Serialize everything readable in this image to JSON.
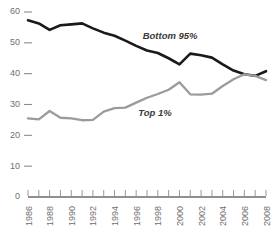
{
  "chart_data": {
    "type": "line",
    "title": "",
    "subtitle": "",
    "xlabel": "",
    "ylabel": "",
    "xlim": [
      1986,
      2008
    ],
    "ylim": [
      0,
      60
    ],
    "grid": false,
    "legend_position": "inline-annotations",
    "x": [
      1986,
      1987,
      1988,
      1989,
      1990,
      1991,
      1992,
      1993,
      1994,
      1995,
      1996,
      1997,
      1998,
      1999,
      2000,
      2001,
      2002,
      2003,
      2004,
      2005,
      2006,
      2007,
      2008
    ],
    "xtick_labels": [
      "1986",
      "1988",
      "1990",
      "1992",
      "1994",
      "1996",
      "1998",
      "2000",
      "2002",
      "2004",
      "2006",
      "2008"
    ],
    "xticks": [
      1986,
      1988,
      1990,
      1992,
      1994,
      1996,
      1998,
      2000,
      2002,
      2004,
      2006,
      2008
    ],
    "ytick_labels": [
      "0",
      "10",
      "20",
      "30",
      "40",
      "50",
      "60"
    ],
    "yticks": [
      0,
      10,
      20,
      30,
      40,
      50,
      60
    ],
    "series": [
      {
        "name": "Bottom 95%",
        "color": "#1a1a1a",
        "label_text": "Bottom 95%",
        "values": [
          57.3,
          56.3,
          54.2,
          55.7,
          56.0,
          56.3,
          54.7,
          53.3,
          52.3,
          50.7,
          49.0,
          47.5,
          46.7,
          45.0,
          43.0,
          46.5,
          46.0,
          45.2,
          43.0,
          41.0,
          39.8,
          39.3,
          40.8
        ]
      },
      {
        "name": "Top 1%",
        "color": "#9b9b9b",
        "label_text": "Top 1%",
        "values": [
          25.5,
          25.2,
          27.9,
          25.7,
          25.5,
          24.9,
          25.0,
          27.7,
          28.8,
          29.0,
          30.6,
          32.2,
          33.4,
          34.8,
          37.2,
          33.3,
          33.2,
          33.5,
          36.0,
          38.2,
          39.8,
          39.3,
          37.9
        ]
      }
    ],
    "annotations": [
      {
        "text": "Bottom 95%",
        "x": 1996.6,
        "y": 51.2
      },
      {
        "text": "Top 1%",
        "x": 1996.2,
        "y": 26.2
      }
    ]
  }
}
